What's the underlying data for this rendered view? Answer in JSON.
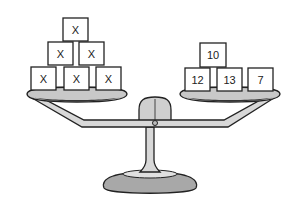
{
  "diagram": {
    "type": "balance-scale",
    "left_pan": {
      "blocks": [
        {
          "label": "X",
          "row": "top",
          "position": 1
        },
        {
          "label": "X",
          "row": "middle",
          "position": 1
        },
        {
          "label": "X",
          "row": "middle",
          "position": 2
        },
        {
          "label": "X",
          "row": "bottom",
          "position": 1
        },
        {
          "label": "X",
          "row": "bottom",
          "position": 2
        },
        {
          "label": "X",
          "row": "bottom",
          "position": 3
        }
      ]
    },
    "right_pan": {
      "blocks": [
        {
          "label": "10",
          "row": "top",
          "position": 1
        },
        {
          "label": "12",
          "row": "bottom",
          "position": 1
        },
        {
          "label": "13",
          "row": "bottom",
          "position": 2
        },
        {
          "label": "7",
          "row": "bottom",
          "position": 3
        }
      ]
    },
    "colors": {
      "pan": "#c8c8c8",
      "beam": "#d8d8d8",
      "base": "#a8a8a8",
      "outline": "#222222"
    }
  }
}
